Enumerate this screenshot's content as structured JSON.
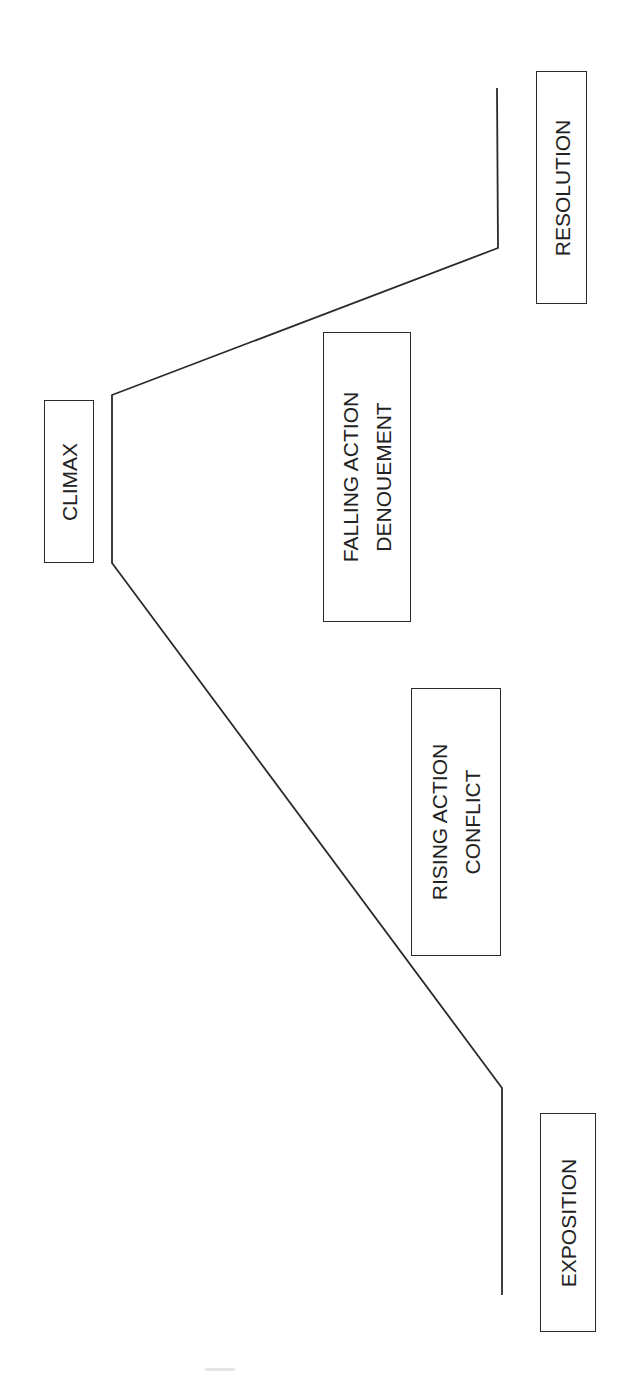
{
  "diagram": {
    "line_color": "#2a2a2a",
    "stages": [
      {
        "id": "exposition",
        "lines": [
          "EXPOSITION"
        ]
      },
      {
        "id": "rising-action",
        "lines": [
          "RISING ACTION",
          "CONFLICT"
        ]
      },
      {
        "id": "climax",
        "lines": [
          "CLIMAX"
        ]
      },
      {
        "id": "falling-action",
        "lines": [
          "FALLING ACTION",
          "DENOUEMENT"
        ]
      },
      {
        "id": "resolution",
        "lines": [
          "RESOLUTION"
        ]
      }
    ]
  }
}
